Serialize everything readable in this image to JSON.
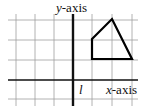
{
  "diagram": {
    "labels": {
      "y_axis": "y-axis",
      "y_axis_var": "y",
      "y_axis_suffix": "-axis",
      "x_axis_var": "x",
      "x_axis_suffix": "-axis",
      "line_label": "l"
    },
    "grid": {
      "vertical_lines_x": [
        16,
        35,
        54,
        92,
        112,
        132
      ],
      "horizontal_lines_y": [
        20,
        40,
        60,
        99
      ],
      "color": "#9a9a9a"
    },
    "axes": {
      "x_axis_y": 80,
      "line_l_x": 73,
      "color": "#111111"
    },
    "shape": {
      "type": "quadrilateral",
      "points": "92,39 112,19 132,59 92,59",
      "stroke": "#000000"
    }
  }
}
